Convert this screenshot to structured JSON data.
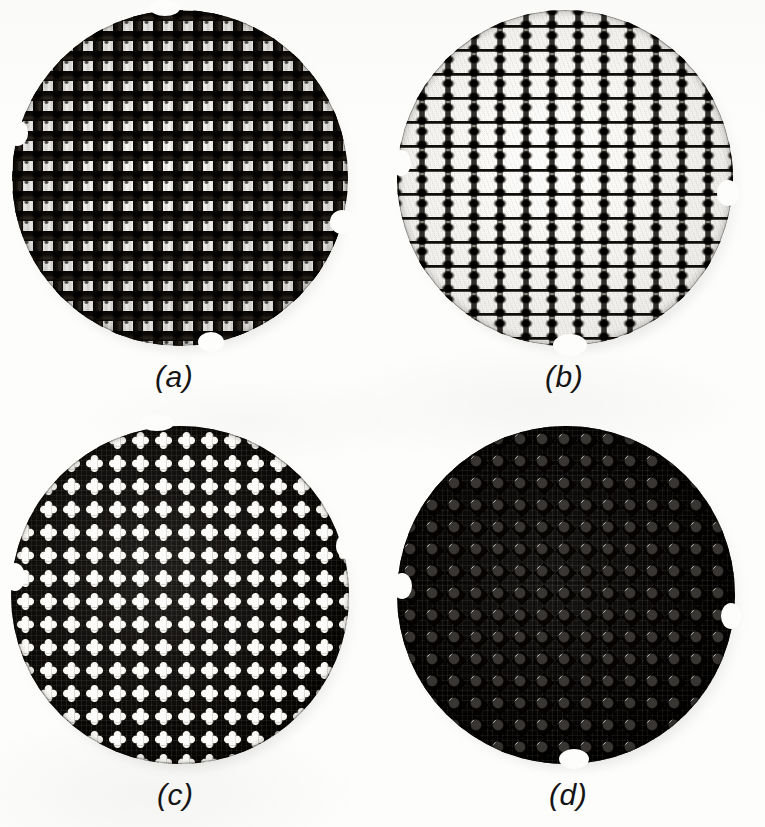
{
  "figure": {
    "kind": "photographic-figure-plate",
    "layout": "2x2",
    "background_color": "#fdfdfc",
    "ink_color": "#141210",
    "pore_color": "#faf9f5",
    "panels": [
      {
        "id": "a",
        "label": "(a)",
        "specimen": "circular woven mesh disc",
        "weave": "plain square mesh",
        "pore_shape": "square",
        "pitch_px": 20,
        "pore_size_px": 10,
        "yarn_width_px": 10,
        "openness": "open",
        "circle": {
          "cx": 180,
          "cy": 178,
          "r": 168
        },
        "label_pos": {
          "x": 155,
          "y": 360
        }
      },
      {
        "id": "b",
        "label": "(b)",
        "specimen": "circular woven mesh disc",
        "weave": "leno / gauze weave with paired warp knots",
        "pore_shape": "rectangular",
        "pitch_px": 26,
        "pore_size_px": 16,
        "yarn_width_px": 3,
        "openness": "very open",
        "circle": {
          "cx": 565,
          "cy": 178,
          "r": 168
        },
        "label_pos": {
          "x": 545,
          "y": 360
        }
      },
      {
        "id": "c",
        "label": "(c)",
        "specimen": "circular woven mesh disc",
        "weave": "dense mesh, four-lobed pores",
        "pore_shape": "clover / four-lobed cross",
        "pitch_px": 23,
        "pore_size_px": 12,
        "yarn_width_px": 11,
        "openness": "tight",
        "circle": {
          "cx": 180,
          "cy": 595,
          "r": 168
        },
        "label_pos": {
          "x": 155,
          "y": 778
        }
      },
      {
        "id": "d",
        "label": "(d)",
        "specimen": "circular woven mesh disc",
        "weave": "dense mesh, diamond pores",
        "pore_shape": "diamond / rounded square",
        "pitch_px": 22,
        "pore_size_px": 11,
        "yarn_width_px": 11,
        "openness": "tight",
        "circle": {
          "cx": 565,
          "cy": 595,
          "r": 168
        },
        "label_pos": {
          "x": 545,
          "y": 778
        }
      }
    ]
  }
}
